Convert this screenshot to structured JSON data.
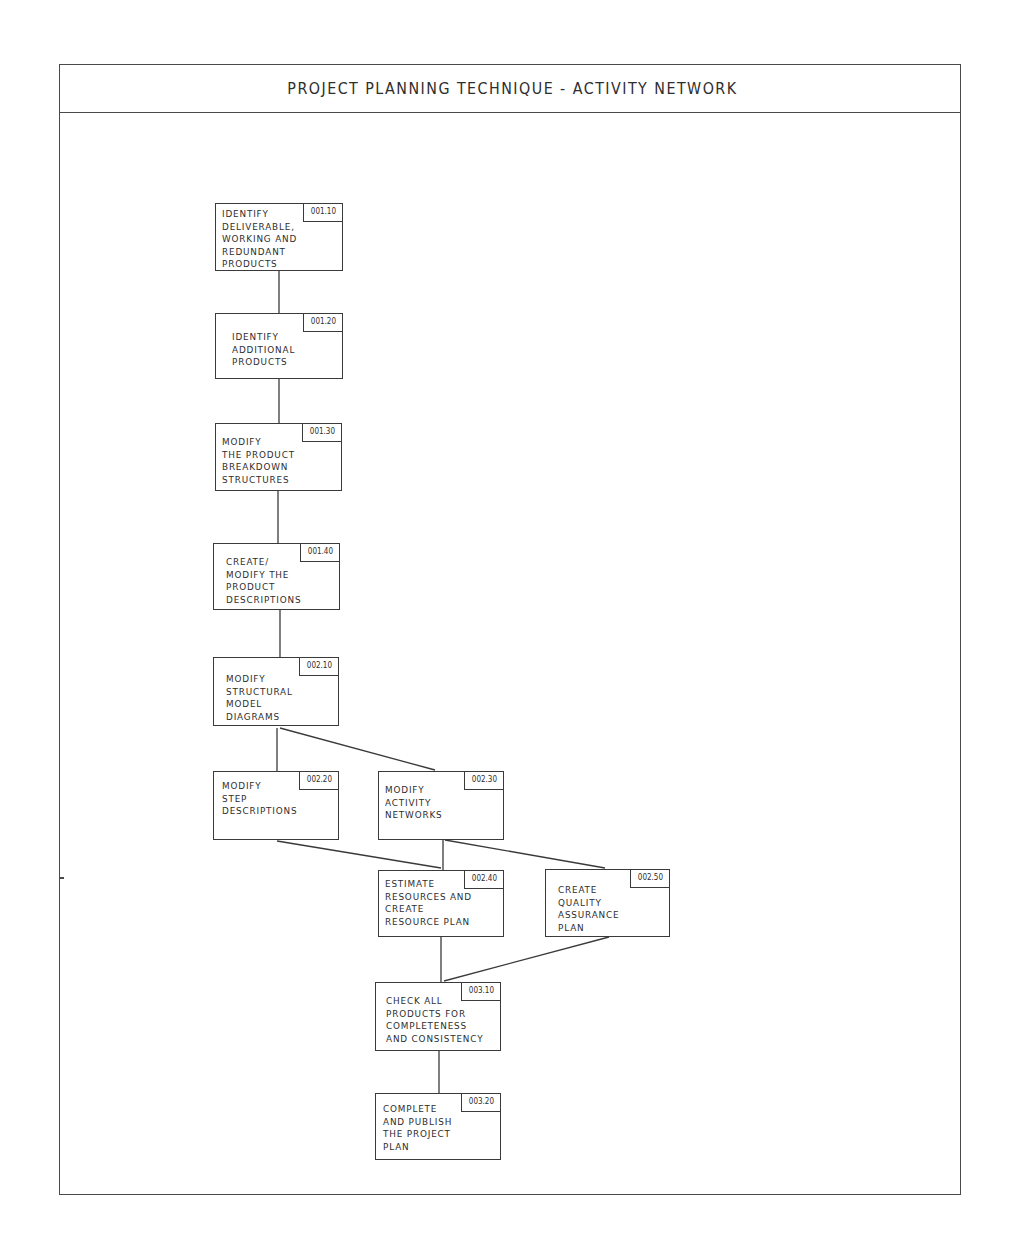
{
  "title": "PROJECT PLANNING TECHNIQUE - ACTIVITY NETWORK",
  "nodes": [
    {
      "id": "001.10",
      "label": "IDENTIFY\nDELIVERABLE,\nWORKING AND\nREDUNDANT\nPRODUCTS",
      "x": 215,
      "y": 203,
      "w": 128,
      "h": 68,
      "tx": 6,
      "ty": 4
    },
    {
      "id": "001.20",
      "label": "IDENTIFY\nADDITIONAL\nPRODUCTS",
      "x": 215,
      "y": 313,
      "w": 128,
      "h": 66,
      "tx": 16,
      "ty": 17
    },
    {
      "id": "001.30",
      "label": "MODIFY\nTHE PRODUCT\nBREAKDOWN\nSTRUCTURES",
      "x": 215,
      "y": 423,
      "w": 127,
      "h": 68,
      "tx": 6,
      "ty": 12
    },
    {
      "id": "001.40",
      "label": "CREATE/\nMODIFY THE\nPRODUCT\nDESCRIPTIONS",
      "x": 213,
      "y": 543,
      "w": 127,
      "h": 67,
      "tx": 12,
      "ty": 12
    },
    {
      "id": "002.10",
      "label": "MODIFY\nSTRUCTURAL\nMODEL\nDIAGRAMS",
      "x": 213,
      "y": 657,
      "w": 126,
      "h": 69,
      "tx": 12,
      "ty": 15
    },
    {
      "id": "002.20",
      "label": "MODIFY\nSTEP\nDESCRIPTIONS",
      "x": 213,
      "y": 771,
      "w": 126,
      "h": 69,
      "tx": 8,
      "ty": 8
    },
    {
      "id": "002.30",
      "label": "MODIFY\nACTIVITY\nNETWORKS",
      "x": 378,
      "y": 771,
      "w": 126,
      "h": 69,
      "tx": 6,
      "ty": 12
    },
    {
      "id": "002.40",
      "label": "ESTIMATE\nRESOURCES AND\nCREATE\nRESOURCE PLAN",
      "x": 378,
      "y": 870,
      "w": 126,
      "h": 67,
      "tx": 6,
      "ty": 7
    },
    {
      "id": "002.50",
      "label": "CREATE\nQUALITY\nASSURANCE\nPLAN",
      "x": 545,
      "y": 869,
      "w": 125,
      "h": 68,
      "tx": 12,
      "ty": 14
    },
    {
      "id": "003.10",
      "label": "CHECK ALL\nPRODUCTS FOR\nCOMPLETENESS\nAND CONSISTENCY",
      "x": 375,
      "y": 982,
      "w": 126,
      "h": 69,
      "tx": 10,
      "ty": 12
    },
    {
      "id": "003.20",
      "label": "COMPLETE\nAND PUBLISH\nTHE PROJECT\nPLAN",
      "x": 375,
      "y": 1093,
      "w": 126,
      "h": 67,
      "tx": 7,
      "ty": 9
    }
  ],
  "links": [
    {
      "from": "001.10",
      "to": "001.20",
      "x1": 279,
      "y1": 271,
      "x2": 279,
      "y2": 313
    },
    {
      "from": "001.20",
      "to": "001.30",
      "x1": 279,
      "y1": 379,
      "x2": 279,
      "y2": 423
    },
    {
      "from": "001.30",
      "to": "001.40",
      "x1": 278,
      "y1": 491,
      "x2": 278,
      "y2": 543
    },
    {
      "from": "001.40",
      "to": "002.10",
      "x1": 280,
      "y1": 610,
      "x2": 280,
      "y2": 657
    },
    {
      "from": "002.10",
      "to": "002.20",
      "x1": 277,
      "y1": 728,
      "x2": 277,
      "y2": 771
    },
    {
      "from": "002.10",
      "to": "002.30",
      "x1": 280,
      "y1": 728,
      "x2": 435,
      "y2": 770
    },
    {
      "from": "002.20",
      "to": "002.40",
      "x1": 277,
      "y1": 841,
      "x2": 441,
      "y2": 868
    },
    {
      "from": "002.30",
      "to": "002.40",
      "x1": 443,
      "y1": 840,
      "x2": 443,
      "y2": 870
    },
    {
      "from": "002.30",
      "to": "002.50",
      "x1": 445,
      "y1": 840,
      "x2": 605,
      "y2": 868
    },
    {
      "from": "002.40",
      "to": "003.10",
      "x1": 441,
      "y1": 937,
      "x2": 441,
      "y2": 982
    },
    {
      "from": "002.50",
      "to": "003.10",
      "x1": 609,
      "y1": 937,
      "x2": 444,
      "y2": 981
    },
    {
      "from": "003.10",
      "to": "003.20",
      "x1": 439,
      "y1": 1051,
      "x2": 439,
      "y2": 1093
    }
  ],
  "colors": {
    "line": "#3a3a3a",
    "text": "#2e2e2e",
    "background": "#ffffff"
  }
}
